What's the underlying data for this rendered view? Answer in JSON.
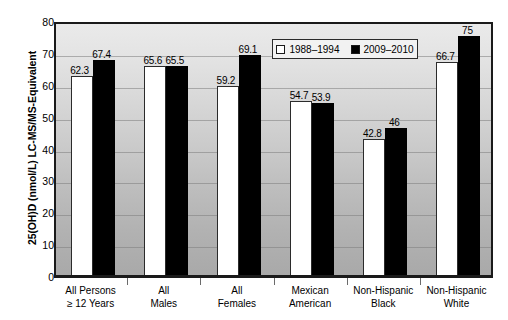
{
  "chart_data": {
    "type": "bar",
    "title": "",
    "xlabel": "",
    "ylabel": "25(OH)D (nmol/L) LC-MS/MS-Equivalent",
    "ylim": [
      0,
      80
    ],
    "ytick_step": 10,
    "yticks": [
      "80",
      "70",
      "60",
      "50",
      "40",
      "30",
      "20",
      "10",
      "0"
    ],
    "grid": true,
    "legend_position": "top-center",
    "categories": [
      "All Persons\n≥ 12 Years",
      "All\nMales",
      "All\nFemales",
      "Mexican\nAmerican",
      "Non-Hispanic\nBlack",
      "Non-Hispanic\nWhite"
    ],
    "category_lines": [
      [
        "All Persons",
        "≥ 12 Years"
      ],
      [
        "All",
        "Males"
      ],
      [
        "All",
        "Females"
      ],
      [
        "Mexican",
        "American"
      ],
      [
        "Non-Hispanic",
        "Black"
      ],
      [
        "Non-Hispanic",
        "White"
      ]
    ],
    "series": [
      {
        "name": "1988–1994",
        "style": "light",
        "color": "#ffffff",
        "values": [
          62.3,
          65.6,
          59.2,
          54.7,
          42.8,
          66.7
        ],
        "labels": [
          "62.3",
          "65.6",
          "59.2",
          "54.7",
          "42.8",
          "66.7"
        ]
      },
      {
        "name": "2009–2010",
        "style": "dark",
        "color": "#000000",
        "values": [
          67.4,
          65.5,
          69.1,
          53.9,
          46,
          75
        ],
        "labels": [
          "67.4",
          "65.5",
          "69.1",
          "53.9",
          "46",
          "75"
        ]
      }
    ]
  },
  "legend": {
    "items": [
      {
        "label": "1988–1994",
        "style": "light"
      },
      {
        "label": "2009–2010",
        "style": "dark"
      }
    ]
  },
  "colors": {
    "bar_light": "#ffffff",
    "bar_dark": "#000000",
    "frame": "#1a1a1a",
    "gridline": "#7d7d7d",
    "plot_bg_top": "#eaeaea",
    "plot_bg_bottom": "#a9a9a9"
  }
}
